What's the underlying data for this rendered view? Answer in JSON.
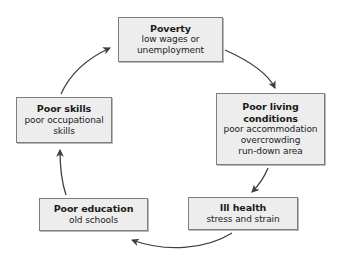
{
  "diagram": {
    "type": "cycle",
    "direction": "clockwise",
    "style": {
      "node_fill": "#ededed",
      "node_border": "#7d7d7d",
      "arrow_color": "#3f3f3f",
      "text_color": "#1b1b1b",
      "background": "#ffffff"
    },
    "nodes": [
      {
        "id": "poverty",
        "title": "Poverty",
        "details": [
          "low wages or",
          "unemployment"
        ]
      },
      {
        "id": "poor-living-conditions",
        "title_lines": [
          "Poor living",
          "conditions"
        ],
        "title": "Poor living conditions",
        "details": [
          "poor accommodation",
          "overcrowding",
          "run-down area"
        ]
      },
      {
        "id": "ill-health",
        "title": "Ill health",
        "details": [
          "stress and strain"
        ]
      },
      {
        "id": "poor-education",
        "title": "Poor education",
        "details": [
          "old schools"
        ]
      },
      {
        "id": "poor-skills",
        "title": "Poor skills",
        "details": [
          "poor occupational",
          "skills"
        ]
      }
    ],
    "edges": [
      {
        "id": "poverty-to-living",
        "from": "Poverty",
        "to": "Poor living conditions"
      },
      {
        "id": "living-to-illhealth",
        "from": "Poor living conditions",
        "to": "Ill health"
      },
      {
        "id": "illhealth-to-education",
        "from": "Ill health",
        "to": "Poor education"
      },
      {
        "id": "education-to-skills",
        "from": "Poor education",
        "to": "Poor skills"
      },
      {
        "id": "skills-to-poverty",
        "from": "Poor skills",
        "to": "Poverty"
      }
    ]
  }
}
